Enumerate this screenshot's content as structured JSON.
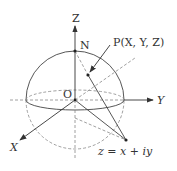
{
  "diagram": {
    "labels": {
      "z_axis": "Z",
      "y_axis": "Y",
      "x_axis": "X",
      "origin": "O",
      "north_pole": "N",
      "point_p": "P(X, Y, Z)",
      "point_z": "z = x + iy"
    },
    "colors": {
      "line": "#444444",
      "dashed": "#888888",
      "background": "#ffffff"
    }
  }
}
